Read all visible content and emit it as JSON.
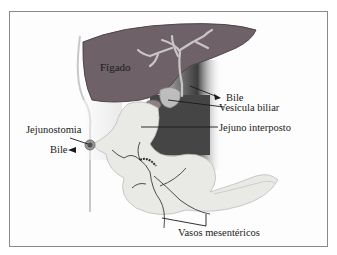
{
  "diagram": {
    "labels": {
      "liver": "Fígado",
      "bile_top": "Bile",
      "gallbladder": "Vesícula biliar",
      "interposed_jejunum": "Jejuno interposto",
      "jejunostomy": "Jejunostomia",
      "bile_left": "Bile",
      "mesenteric_vessels": "Vasos mesentéricos"
    },
    "colors": {
      "liver": "#6e6168",
      "liver_edge": "#4f4449",
      "bile_ducts": "#c9c4c6",
      "jejunum": "#e9e9e6",
      "dark_background": "#4a4a4a",
      "vessels": "#3a3a3a",
      "frame": "#8a8a8a"
    }
  }
}
